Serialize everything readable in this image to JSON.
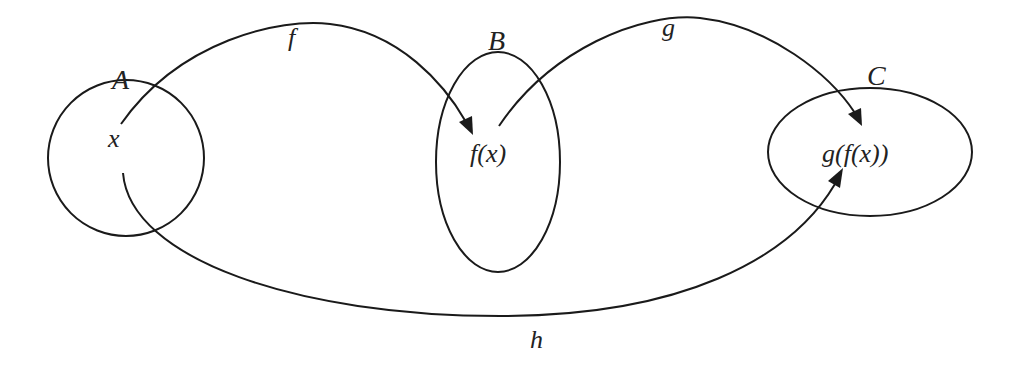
{
  "diagram": {
    "type": "function-composition",
    "sets": [
      {
        "id": "A",
        "label": "A",
        "element": "x"
      },
      {
        "id": "B",
        "label": "B",
        "element": "f(x)"
      },
      {
        "id": "C",
        "label": "C",
        "element": "g(f(x))"
      }
    ],
    "arrows": [
      {
        "id": "f",
        "label": "f",
        "from": "x",
        "to": "f(x)"
      },
      {
        "id": "g",
        "label": "g",
        "from": "f(x)",
        "to": "g(f(x))"
      },
      {
        "id": "h",
        "label": "h",
        "from": "x",
        "to": "g(f(x))"
      }
    ],
    "colors": {
      "stroke": "#1a1a1a",
      "text": "#222222",
      "background": "#ffffff"
    }
  }
}
